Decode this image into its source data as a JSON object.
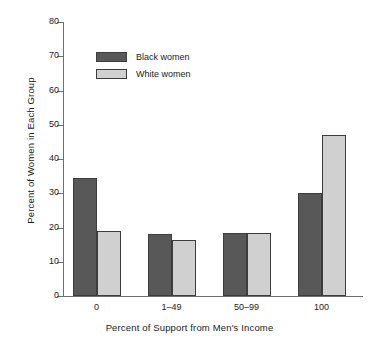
{
  "chart_data": {
    "type": "bar",
    "title": "",
    "xlabel": "Percent of Support from Men's Income",
    "ylabel": "Percent of Women in Each Group",
    "categories": [
      "0",
      "1–49",
      "50–99",
      "100"
    ],
    "series": [
      {
        "name": "Black women",
        "color": "#585858",
        "values": [
          34.5,
          18.0,
          18.3,
          30.0
        ]
      },
      {
        "name": "White women",
        "color": "#d0d0d0",
        "values": [
          19.0,
          16.3,
          18.5,
          47.0
        ]
      }
    ],
    "ylim": [
      0,
      80
    ],
    "yticks": [
      0,
      10,
      20,
      30,
      40,
      50,
      60,
      70,
      80
    ],
    "ytick_labels": [
      "0",
      "10",
      "20",
      "30",
      "40",
      "50",
      "60",
      "70",
      "80"
    ],
    "grid": false,
    "legend_position": "upper-left-inside"
  },
  "legend": {
    "items": [
      {
        "label": "Black women",
        "swatch": "dark-swatch"
      },
      {
        "label": "White women",
        "swatch": "light-swatch"
      }
    ]
  }
}
